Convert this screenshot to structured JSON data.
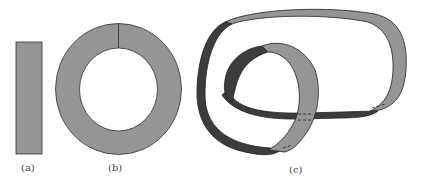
{
  "figure": {
    "panels": [
      {
        "id": "a",
        "label": "(a)",
        "description": "flat strip"
      },
      {
        "id": "b",
        "label": "(b)",
        "description": "annulus with seam"
      },
      {
        "id": "c",
        "label": "(c)",
        "description": "twisted knotted band"
      }
    ],
    "colors": {
      "light_band": "#959595",
      "dark_band": "#3c3c3c",
      "outline": "#222222"
    }
  }
}
